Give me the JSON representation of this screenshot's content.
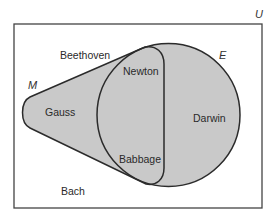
{
  "diagram": {
    "type": "venn",
    "universe": {
      "label": "U",
      "rect": {
        "x": 14,
        "y": 24,
        "width": 248,
        "height": 184
      }
    },
    "sets": [
      {
        "id": "M",
        "label": "M",
        "shape": "teardrop",
        "fill": "#c9c9c9"
      },
      {
        "id": "E",
        "label": "E",
        "shape": "circle",
        "fill": "#c9c9c9",
        "cx": 168.5,
        "cy": 115,
        "r": 71.5
      }
    ],
    "elements": [
      {
        "name": "Beethoven",
        "region": "U only"
      },
      {
        "name": "Gauss",
        "region": "M only"
      },
      {
        "name": "Newton",
        "region": "M and E"
      },
      {
        "name": "Babbage",
        "region": "M and E"
      },
      {
        "name": "Darwin",
        "region": "E only"
      },
      {
        "name": "Bach",
        "region": "U only"
      }
    ],
    "colors": {
      "stroke": "#2b2b2b",
      "fill": "#c9c9c9",
      "background": "#ffffff",
      "border": "#444444"
    }
  },
  "labels": {
    "universe": "U",
    "set_m": "M",
    "set_e": "E",
    "beethoven": "Beethoven",
    "gauss": "Gauss",
    "newton": "Newton",
    "babbage": "Babbage",
    "darwin": "Darwin",
    "bach": "Bach"
  }
}
